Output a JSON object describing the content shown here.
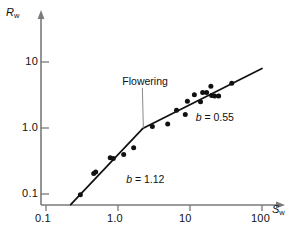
{
  "chart_data": {
    "type": "scatter",
    "title": "",
    "xlabel": "S_w",
    "ylabel": "R_w",
    "xlabel_base": "S",
    "xlabel_sub": "w",
    "ylabel_base": "R",
    "ylabel_sub": "w",
    "xscale": "log",
    "yscale": "log",
    "xlim": [
      0.1,
      150
    ],
    "ylim": [
      0.07,
      30
    ],
    "grid": false,
    "legend": "none",
    "xticks": [
      "0.1",
      "1.0",
      "10",
      "100"
    ],
    "xtick_values": [
      0.1,
      1.0,
      10,
      100
    ],
    "yticks": [
      "10",
      "1.0",
      "0.1"
    ],
    "ytick_values": [
      10,
      1.0,
      0.1
    ],
    "points": [
      {
        "x": 0.3,
        "y": 0.097
      },
      {
        "x": 0.46,
        "y": 0.205
      },
      {
        "x": 0.49,
        "y": 0.215
      },
      {
        "x": 0.78,
        "y": 0.355
      },
      {
        "x": 0.86,
        "y": 0.345
      },
      {
        "x": 1.2,
        "y": 0.395
      },
      {
        "x": 1.65,
        "y": 0.5
      },
      {
        "x": 3.0,
        "y": 1.05
      },
      {
        "x": 4.9,
        "y": 1.15
      },
      {
        "x": 6.5,
        "y": 1.85
      },
      {
        "x": 8.6,
        "y": 1.6
      },
      {
        "x": 9.2,
        "y": 2.55
      },
      {
        "x": 11.5,
        "y": 3.2
      },
      {
        "x": 14.0,
        "y": 2.5
      },
      {
        "x": 15.0,
        "y": 3.45
      },
      {
        "x": 17.0,
        "y": 3.45
      },
      {
        "x": 19.5,
        "y": 4.3
      },
      {
        "x": 20.0,
        "y": 3.1
      },
      {
        "x": 22.0,
        "y": 3.05
      },
      {
        "x": 25.0,
        "y": 3.05
      },
      {
        "x": 38.0,
        "y": 4.75
      }
    ],
    "fit_segments": [
      {
        "name": "pre-flowering",
        "slope_label": "b = 1.12",
        "slope": 1.12,
        "x_start": 0.22,
        "y_start": 0.069,
        "x_end": 2.2,
        "y_end": 0.98
      },
      {
        "name": "post-flowering",
        "slope_label": "b = 0.55",
        "slope": 0.55,
        "x_start": 2.2,
        "y_start": 0.98,
        "x_end": 100.0,
        "y_end": 8.0
      }
    ],
    "annotations": [
      {
        "name": "flowering",
        "text": "Flowering",
        "x": 1.15,
        "y": 5.0,
        "leader_to_x": 2.25,
        "leader_to_y": 0.99
      },
      {
        "name": "slope-upper",
        "text_plain": "b = 0.55",
        "symbol": "b",
        "equals": " = ",
        "value": "0.55",
        "x": 12.0,
        "y": 1.4
      },
      {
        "name": "slope-lower",
        "text_plain": "b = 1.12",
        "symbol": "b",
        "equals": " = ",
        "value": "1.12",
        "x": 1.3,
        "y": 0.165
      }
    ],
    "style": {
      "axis_color": "#7a7a7a",
      "line_color": "#111111",
      "marker_color": "#111111",
      "marker_size_px": 5,
      "background": "#ffffff"
    }
  },
  "accessibility": {
    "figure_description": "Log-log scatter plot of R sub w versus S sub w with a two-segment broken-stick fit; lower segment slope b = 1.12, upper segment slope b = 0.55, break labelled Flowering."
  }
}
